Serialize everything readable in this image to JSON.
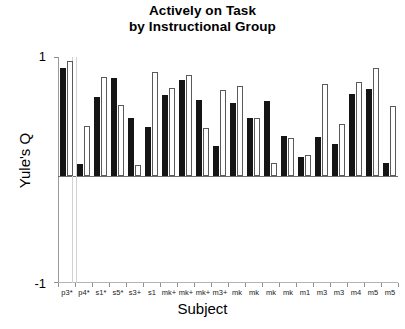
{
  "chart_data": {
    "type": "bar",
    "title": "Actively on Task by Instructional Group",
    "title_lines": [
      "Actively on Task",
      "by Instructional Group"
    ],
    "xlabel": "Subject",
    "ylabel": "Yule's Q",
    "ylim": [
      -1,
      1
    ],
    "ytick_labels": [
      "1",
      "-1"
    ],
    "ytick_values": [
      1,
      -1
    ],
    "grid": false,
    "legend": "none",
    "categories": [
      "p3*",
      "p4*",
      "s1*",
      "s5*",
      "s3+",
      "s1",
      "mk+",
      "mk+",
      "mk+",
      "m3+",
      "mk",
      "mk",
      "mk",
      "mk",
      "m1",
      "m3",
      "m3",
      "m4",
      "m5",
      "m5"
    ],
    "series": [
      {
        "name": "series-1",
        "color": "#151515",
        "style": "filled",
        "values": [
          0.91,
          0.1,
          0.66,
          0.82,
          0.49,
          0.41,
          0.68,
          0.81,
          0.64,
          0.25,
          0.61,
          0.49,
          0.63,
          0.34,
          0.16,
          0.33,
          0.27,
          0.69,
          0.73,
          0.11
        ]
      },
      {
        "name": "series-2",
        "color": "#ffffff",
        "style": "outlined",
        "values": [
          0.97,
          0.42,
          0.83,
          0.6,
          0.09,
          0.87,
          0.74,
          0.85,
          0.4,
          0.72,
          0.76,
          0.49,
          0.11,
          0.32,
          0.18,
          0.77,
          0.44,
          0.79,
          0.91,
          0.59
        ]
      }
    ]
  }
}
